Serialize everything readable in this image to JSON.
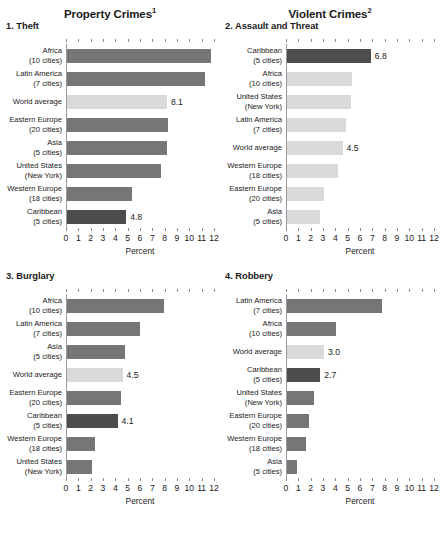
{
  "groups": [
    {
      "title": "Property Crimes",
      "footnote_marker": "1"
    },
    {
      "title": "Violent Crimes",
      "footnote_marker": "2"
    }
  ],
  "axis": {
    "title": "Percent",
    "ticks": [
      "0",
      "1",
      "2",
      "3",
      "4",
      "5",
      "6",
      "7",
      "8",
      "9",
      "10",
      "11",
      "12"
    ],
    "min": 0,
    "max": 12
  },
  "colors": {
    "bar_default": "#767676",
    "bar_world_average": "#d9d9d9",
    "bar_caribbean": "#4d4d4d",
    "axis_line": "#9a9a9a",
    "text": "#1a1a1a"
  },
  "panels": [
    {
      "number": "1.",
      "title": "1. Theft",
      "rows": [
        {
          "name": "Africa",
          "sub": "(10 cities)",
          "value": 11.7,
          "style": "default",
          "label": ""
        },
        {
          "name": "Latin America",
          "sub": "(7 cities)",
          "value": 11.2,
          "style": "default",
          "label": ""
        },
        {
          "name": "World average",
          "sub": "",
          "value": 8.1,
          "style": "light",
          "label": "8.1"
        },
        {
          "name": "Eastern Europe",
          "sub": "(20 cities)",
          "value": 8.2,
          "style": "default",
          "label": ""
        },
        {
          "name": "Asia",
          "sub": "(5 cities)",
          "value": 8.1,
          "style": "default",
          "label": ""
        },
        {
          "name": "United States",
          "sub": "(New York)",
          "value": 7.6,
          "style": "default",
          "label": ""
        },
        {
          "name": "Western Europe",
          "sub": "(18 cities)",
          "value": 5.3,
          "style": "default",
          "label": ""
        },
        {
          "name": "Caribbean",
          "sub": "(5 cities)",
          "value": 4.8,
          "style": "dark",
          "label": "4.8"
        }
      ]
    },
    {
      "number": "2.",
      "title": "2. Assault and Threat",
      "rows": [
        {
          "name": "Caribbean",
          "sub": "(5 cities)",
          "value": 6.8,
          "style": "dark",
          "label": "6.8"
        },
        {
          "name": "Africa",
          "sub": "(10 cities)",
          "value": 5.3,
          "style": "light",
          "label": ""
        },
        {
          "name": "United States",
          "sub": "(New York)",
          "value": 5.2,
          "style": "light",
          "label": ""
        },
        {
          "name": "Latin America",
          "sub": "(7 cities)",
          "value": 4.8,
          "style": "light",
          "label": ""
        },
        {
          "name": "World average",
          "sub": "",
          "value": 4.5,
          "style": "light",
          "label": "4.5"
        },
        {
          "name": "Western Europe",
          "sub": "(18 cities)",
          "value": 4.1,
          "style": "light",
          "label": ""
        },
        {
          "name": "Eastern Europe",
          "sub": "(20 cities)",
          "value": 3.0,
          "style": "light",
          "label": ""
        },
        {
          "name": "Asia",
          "sub": "(5 cities)",
          "value": 2.7,
          "style": "light",
          "label": ""
        }
      ]
    },
    {
      "number": "3.",
      "title": "3. Burglary",
      "rows": [
        {
          "name": "Africa",
          "sub": "(10 cities)",
          "value": 7.9,
          "style": "default",
          "label": ""
        },
        {
          "name": "Latin America",
          "sub": "(7 cities)",
          "value": 5.9,
          "style": "default",
          "label": ""
        },
        {
          "name": "Asia",
          "sub": "(5 cities)",
          "value": 4.7,
          "style": "default",
          "label": ""
        },
        {
          "name": "World average",
          "sub": "",
          "value": 4.5,
          "style": "light",
          "label": "4.5"
        },
        {
          "name": "Eastern Europe",
          "sub": "(20 cities)",
          "value": 4.4,
          "style": "default",
          "label": ""
        },
        {
          "name": "Caribbean",
          "sub": "(5 cities)",
          "value": 4.1,
          "style": "dark",
          "label": "4.1"
        },
        {
          "name": "Western Europe",
          "sub": "(18 cities)",
          "value": 2.3,
          "style": "default",
          "label": ""
        },
        {
          "name": "United States",
          "sub": "(New York)",
          "value": 2.0,
          "style": "default",
          "label": ""
        }
      ]
    },
    {
      "number": "4.",
      "title": "4. Robbery",
      "rows": [
        {
          "name": "Latin America",
          "sub": "(7 cities)",
          "value": 7.7,
          "style": "default",
          "label": ""
        },
        {
          "name": "Africa",
          "sub": "(10 cities)",
          "value": 4.0,
          "style": "default",
          "label": ""
        },
        {
          "name": "World average",
          "sub": "",
          "value": 3.0,
          "style": "light",
          "label": "3.0"
        },
        {
          "name": "Caribbean",
          "sub": "(5 cities)",
          "value": 2.7,
          "style": "dark",
          "label": "2.7"
        },
        {
          "name": "United States",
          "sub": "(New York)",
          "value": 2.2,
          "style": "default",
          "label": ""
        },
        {
          "name": "Eastern Europe",
          "sub": "(20 cities)",
          "value": 1.8,
          "style": "default",
          "label": ""
        },
        {
          "name": "Western Europe",
          "sub": "(18 cities)",
          "value": 1.5,
          "style": "default",
          "label": ""
        },
        {
          "name": "Asia",
          "sub": "(5 cities)",
          "value": 0.8,
          "style": "default",
          "label": ""
        }
      ]
    }
  ],
  "chart_data": [
    {
      "type": "bar",
      "orientation": "horizontal",
      "title": "1. Theft",
      "group": "Property Crimes",
      "xlabel": "Percent",
      "ylabel": "",
      "xlim": [
        0,
        12
      ],
      "grid": false,
      "legend": "none",
      "categories": [
        "Africa (10 cities)",
        "Latin America (7 cities)",
        "World average",
        "Eastern Europe (20 cities)",
        "Asia (5 cities)",
        "United States (New York)",
        "Western Europe (18 cities)",
        "Caribbean (5 cities)"
      ],
      "values": [
        11.7,
        11.2,
        8.1,
        8.2,
        8.1,
        7.6,
        5.3,
        4.8
      ],
      "data_labels": [
        "",
        "",
        "8.1",
        "",
        "",
        "",
        "",
        "4.8"
      ]
    },
    {
      "type": "bar",
      "orientation": "horizontal",
      "title": "2. Assault and Threat",
      "group": "Violent Crimes",
      "xlabel": "Percent",
      "ylabel": "",
      "xlim": [
        0,
        12
      ],
      "grid": false,
      "legend": "none",
      "categories": [
        "Caribbean (5 cities)",
        "Africa (10 cities)",
        "United States (New York)",
        "Latin America (7 cities)",
        "World average",
        "Western Europe (18 cities)",
        "Eastern Europe (20 cities)",
        "Asia (5 cities)"
      ],
      "values": [
        6.8,
        5.3,
        5.2,
        4.8,
        4.5,
        4.1,
        3.0,
        2.7
      ],
      "data_labels": [
        "6.8",
        "",
        "",
        "",
        "4.5",
        "",
        "",
        ""
      ]
    },
    {
      "type": "bar",
      "orientation": "horizontal",
      "title": "3. Burglary",
      "group": "Property Crimes",
      "xlabel": "Percent",
      "ylabel": "",
      "xlim": [
        0,
        12
      ],
      "grid": false,
      "legend": "none",
      "categories": [
        "Africa (10 cities)",
        "Latin America (7 cities)",
        "Asia (5 cities)",
        "World average",
        "Eastern Europe (20 cities)",
        "Caribbean (5 cities)",
        "Western Europe (18 cities)",
        "United States (New York)"
      ],
      "values": [
        7.9,
        5.9,
        4.7,
        4.5,
        4.4,
        4.1,
        2.3,
        2.0
      ],
      "data_labels": [
        "",
        "",
        "",
        "4.5",
        "",
        "4.1",
        "",
        ""
      ]
    },
    {
      "type": "bar",
      "orientation": "horizontal",
      "title": "4. Robbery",
      "group": "Violent Crimes",
      "xlabel": "Percent",
      "ylabel": "",
      "xlim": [
        0,
        12
      ],
      "grid": false,
      "legend": "none",
      "categories": [
        "Latin America (7 cities)",
        "Africa (10 cities)",
        "World average",
        "Caribbean (5 cities)",
        "United States (New York)",
        "Eastern Europe (20 cities)",
        "Western Europe (18 cities)",
        "Asia (5 cities)"
      ],
      "values": [
        7.7,
        4.0,
        3.0,
        2.7,
        2.2,
        1.8,
        1.5,
        0.8
      ],
      "data_labels": [
        "",
        "",
        "3.0",
        "2.7",
        "",
        "",
        "",
        ""
      ]
    }
  ]
}
